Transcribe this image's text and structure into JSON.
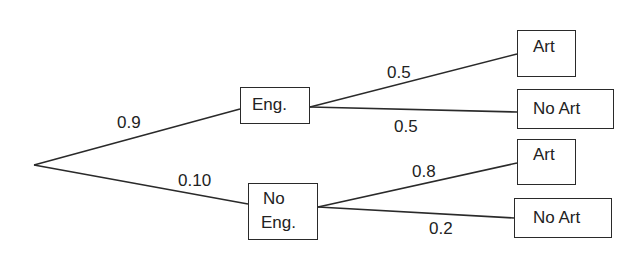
{
  "diagram": {
    "type": "probability-tree",
    "root": {
      "x": 34,
      "y": 165
    },
    "nodes": [
      {
        "id": "eng",
        "label": "Eng.",
        "box": {
          "x": 240,
          "y": 87,
          "w": 70,
          "h": 37
        }
      },
      {
        "id": "no-eng",
        "label": "No Eng.",
        "lines": [
          "No",
          "Eng."
        ],
        "box": {
          "x": 248,
          "y": 183,
          "w": 70,
          "h": 57
        }
      },
      {
        "id": "eng-art",
        "label": "Art",
        "box": {
          "x": 517,
          "y": 30,
          "w": 59,
          "h": 47
        }
      },
      {
        "id": "eng-no-art",
        "label": "No Art",
        "box": {
          "x": 517,
          "y": 89,
          "w": 97,
          "h": 40
        }
      },
      {
        "id": "noeng-art",
        "label": "Art",
        "box": {
          "x": 517,
          "y": 139,
          "w": 59,
          "h": 46
        }
      },
      {
        "id": "noeng-no-art",
        "label": "No Art",
        "box": {
          "x": 514,
          "y": 198,
          "w": 98,
          "h": 40
        }
      }
    ],
    "edges": [
      {
        "from": "root",
        "to": "eng",
        "probability": "0.9"
      },
      {
        "from": "root",
        "to": "no-eng",
        "probability": "0.10"
      },
      {
        "from": "eng",
        "to": "eng-art",
        "probability": "0.5"
      },
      {
        "from": "eng",
        "to": "eng-no-art",
        "probability": "0.5"
      },
      {
        "from": "no-eng",
        "to": "noeng-art",
        "probability": "0.8"
      },
      {
        "from": "no-eng",
        "to": "noeng-no-art",
        "probability": "0.2"
      }
    ]
  },
  "labels": {
    "eng": "Eng.",
    "no_eng_line1": "No",
    "no_eng_line2": "Eng.",
    "art": "Art",
    "no_art": "No Art",
    "p_eng": "0.9",
    "p_no_eng": "0.10",
    "p_eng_art": "0.5",
    "p_eng_no_art": "0.5",
    "p_noeng_art": "0.8",
    "p_noeng_no_art": "0.2"
  },
  "colors": {
    "line": "#2a2a2a",
    "text": "#222222",
    "background": "#ffffff"
  }
}
